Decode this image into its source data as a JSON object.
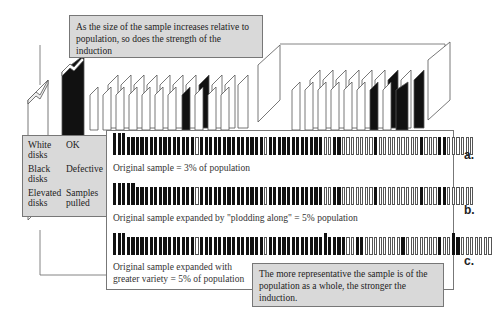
{
  "top_callout": {
    "text": "As the size of the sample increases relative to population, so does the strength of the induction"
  },
  "legend": {
    "rows": [
      {
        "key": "White disks",
        "value": "OK"
      },
      {
        "key": "Black disks",
        "value": "Defective"
      },
      {
        "key": "Elevated disks",
        "value": "Samples pulled"
      }
    ]
  },
  "rows": [
    {
      "label": "a.",
      "caption": "Original sample = 3% of population",
      "pattern": "EEEBBBBBBBBBBBBBBBWBBBBBBBBBBBBBBWBBBBBBBBBBBBWWBBWWWWWWWBWWWWWWWWWBWWWBBWWWWWW"
    },
    {
      "label": "b.",
      "caption": "Original sample expanded by \"plodding along\" = 5% population",
      "pattern": "EEEEEBBBBBBBBBBBBBWBBBBBBBBBBBBBBWBBBBBBBBBBBBWWBBWWWWWWWBWWWWWWWWWBWWWBBWWWWWW"
    },
    {
      "label": "c.",
      "caption": "Original sample expanded with greater variety = 5% of population",
      "pattern": "EEEBBBBBBBBBBBBBBBWBBBBBBBBBBBBBBWBBBBBBBBBBBBTBBBBWWBBWWWWWWWWBWWWWWWWBWWTBWWWWWWW"
    }
  ],
  "bottom_callout": {
    "text": "The more representative the sample is of the population as a whole, the stronger the induction."
  },
  "colors": {
    "callout_bg": "#d9d9d9",
    "defective": "#111111",
    "ok": "#ffffff",
    "outline": "#555555"
  }
}
